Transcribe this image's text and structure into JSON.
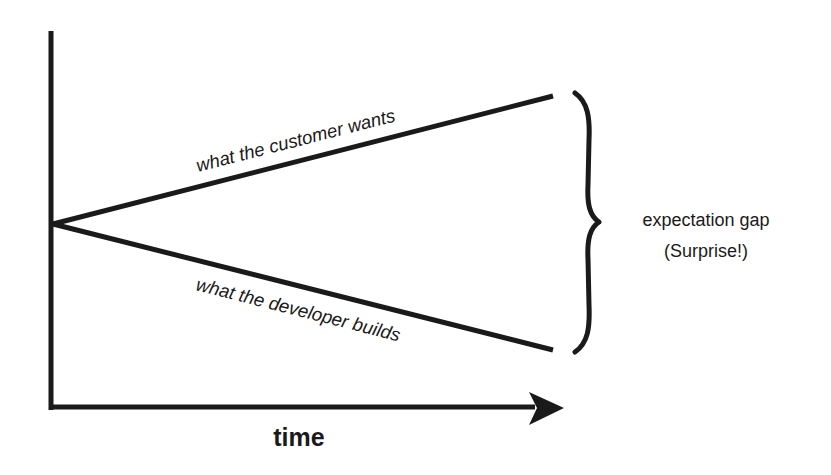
{
  "diagram": {
    "axes": {
      "x_label": "time",
      "y_label": ""
    },
    "lines": [
      {
        "name": "customer",
        "label": "what the customer wants",
        "direction": "up"
      },
      {
        "name": "developer",
        "label": "what the developer builds",
        "direction": "down"
      }
    ],
    "annotation": {
      "line1": "expectation gap",
      "line2": "(Surprise!)"
    },
    "colors": {
      "stroke": "#1a1a1a",
      "background": "#ffffff"
    }
  }
}
